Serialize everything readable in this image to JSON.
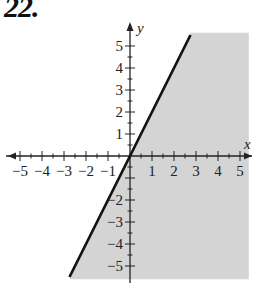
{
  "problem_number": "22.",
  "chart_data": {
    "type": "line",
    "title": "",
    "xlabel": "x",
    "ylabel": "y",
    "xlim": [
      -5.5,
      5.5
    ],
    "ylim": [
      -5.6,
      5.6
    ],
    "x_ticks": [
      "-5",
      "-4",
      "-3",
      "-2",
      "-1",
      "1",
      "2",
      "3",
      "4",
      "5"
    ],
    "y_ticks": [
      "5",
      "4",
      "3",
      "2",
      "1",
      "-2",
      "-3",
      "-4",
      "-5"
    ],
    "minor_ticks_per_unit": 2,
    "grid": false,
    "series": [
      {
        "name": "boundary line y = 2x",
        "style": "solid",
        "color": "#111111",
        "x": [
          -2.75,
          0,
          2.75
        ],
        "y": [
          -5.5,
          0,
          5.5
        ]
      }
    ],
    "shaded_region": {
      "inequality": "y <= 2x",
      "color": "#d4d4d4",
      "vertices": [
        [
          -2.75,
          -5.6
        ],
        [
          2.75,
          5.6
        ],
        [
          5.4,
          5.6
        ],
        [
          5.4,
          -5.6
        ]
      ]
    }
  }
}
